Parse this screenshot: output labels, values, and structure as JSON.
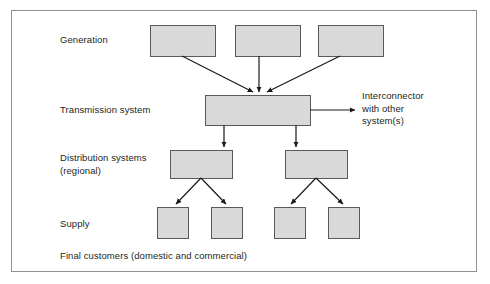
{
  "diagram": {
    "frame": {
      "x": 11,
      "y": 10,
      "width": 466,
      "height": 262,
      "border_color": "#8e8e8e"
    },
    "style": {
      "box_fill": "#d9d9d9",
      "box_stroke": "#5a5a5a",
      "arrow_color": "#1a1a1a",
      "text_color": "#231f20",
      "background": "#ffffff"
    },
    "row_labels": [
      {
        "id": "generation",
        "text": "Generation"
      },
      {
        "id": "transmission",
        "text": "Transmission system"
      },
      {
        "id": "distribution",
        "text": "Distribution systems\n(regional)"
      },
      {
        "id": "supply",
        "text": "Supply"
      }
    ],
    "caption": "Final customers (domestic and commercial)",
    "interconnector_label": "Interconnector\nwith other\nsystem(s)",
    "nodes": {
      "generation": [
        {
          "id": "generation-box-1",
          "x": 150,
          "y": 25,
          "width": 65,
          "height": 31
        },
        {
          "id": "generation-box-2",
          "x": 235,
          "y": 25,
          "width": 65,
          "height": 31
        },
        {
          "id": "generation-box-3",
          "x": 318,
          "y": 25,
          "width": 65,
          "height": 31
        }
      ],
      "transmission": [
        {
          "id": "transmission-box",
          "x": 205,
          "y": 95,
          "width": 105,
          "height": 30
        }
      ],
      "distribution": [
        {
          "id": "distribution-box-1",
          "x": 170,
          "y": 150,
          "width": 62,
          "height": 28
        },
        {
          "id": "distribution-box-2",
          "x": 285,
          "y": 150,
          "width": 62,
          "height": 28
        }
      ],
      "supply": [
        {
          "id": "supply-box-1",
          "x": 157,
          "y": 207,
          "width": 31,
          "height": 31
        },
        {
          "id": "supply-box-2",
          "x": 211,
          "y": 207,
          "width": 31,
          "height": 31
        },
        {
          "id": "supply-box-3",
          "x": 274,
          "y": 207,
          "width": 31,
          "height": 31
        },
        {
          "id": "supply-box-4",
          "x": 328,
          "y": 207,
          "width": 31,
          "height": 31
        }
      ]
    },
    "edges": [
      {
        "id": "edge-gen1-transmission",
        "from": "generation-box-1",
        "to": "transmission-box",
        "x1": 182,
        "y1": 56,
        "x2": 253,
        "y2": 93
      },
      {
        "id": "edge-gen2-transmission",
        "from": "generation-box-2",
        "to": "transmission-box",
        "x1": 259,
        "y1": 56,
        "x2": 259,
        "y2": 93
      },
      {
        "id": "edge-gen3-transmission",
        "from": "generation-box-3",
        "to": "transmission-box",
        "x1": 340,
        "y1": 56,
        "x2": 266,
        "y2": 93
      },
      {
        "id": "edge-transmission-interconnector",
        "from": "transmission-box",
        "to": "interconnector",
        "x1": 310,
        "y1": 110,
        "x2": 357,
        "y2": 110
      },
      {
        "id": "edge-transmission-dist1",
        "from": "transmission-box",
        "to": "distribution-box-1",
        "x1": 224,
        "y1": 125,
        "x2": 224,
        "y2": 148
      },
      {
        "id": "edge-transmission-dist2",
        "from": "transmission-box",
        "to": "distribution-box-2",
        "x1": 296,
        "y1": 125,
        "x2": 296,
        "y2": 148
      },
      {
        "id": "edge-dist1-supply1",
        "from": "distribution-box-1",
        "to": "supply-box-1",
        "x1": 201,
        "y1": 178,
        "x2": 175,
        "y2": 205
      },
      {
        "id": "edge-dist1-supply2",
        "from": "distribution-box-1",
        "to": "supply-box-2",
        "x1": 201,
        "y1": 178,
        "x2": 227,
        "y2": 205
      },
      {
        "id": "edge-dist2-supply3",
        "from": "distribution-box-2",
        "to": "supply-box-3",
        "x1": 316,
        "y1": 178,
        "x2": 290,
        "y2": 205
      },
      {
        "id": "edge-dist2-supply4",
        "from": "distribution-box-2",
        "to": "supply-box-4",
        "x1": 316,
        "y1": 178,
        "x2": 344,
        "y2": 205
      }
    ]
  }
}
